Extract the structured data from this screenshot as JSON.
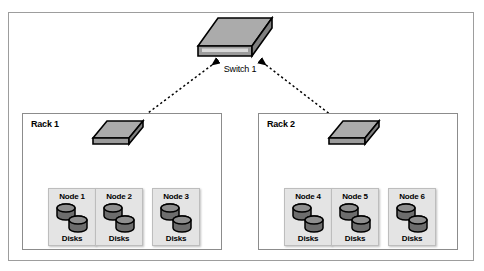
{
  "diagram": {
    "core_switch": {
      "label": "Switch 1",
      "icon": "network-switch-icon"
    },
    "racks": [
      {
        "label": "Rack 1",
        "switch": {
          "icon": "network-switch-icon"
        },
        "nodes": [
          {
            "label": "Node 1",
            "storage_label": "Disks",
            "icon": "disk-stack-icon"
          },
          {
            "label": "Node 2",
            "storage_label": "Disks",
            "icon": "disk-stack-icon"
          },
          {
            "label": "Node 3",
            "storage_label": "Disks",
            "icon": "disk-stack-icon"
          }
        ]
      },
      {
        "label": "Rack 2",
        "switch": {
          "icon": "network-switch-icon"
        },
        "nodes": [
          {
            "label": "Node 4",
            "storage_label": "Disks",
            "icon": "disk-stack-icon"
          },
          {
            "label": "Node 5",
            "storage_label": "Disks",
            "icon": "disk-stack-icon"
          },
          {
            "label": "Node 6",
            "storage_label": "Disks",
            "icon": "disk-stack-icon"
          }
        ]
      }
    ],
    "links": [
      {
        "from": "Switch 1",
        "to": "Rack 1 switch",
        "style": "dotted-bidirectional"
      },
      {
        "from": "Switch 1",
        "to": "Rack 2 switch",
        "style": "dotted-bidirectional"
      },
      {
        "from": "Rack 1 switch",
        "to": "Node 1",
        "style": "dotted-bidirectional"
      },
      {
        "from": "Rack 1 switch",
        "to": "Node 2",
        "style": "dotted-bidirectional"
      },
      {
        "from": "Rack 1 switch",
        "to": "Node 3",
        "style": "dotted-bidirectional"
      },
      {
        "from": "Rack 2 switch",
        "to": "Node 4",
        "style": "dotted-bidirectional"
      },
      {
        "from": "Rack 2 switch",
        "to": "Node 5",
        "style": "dotted-bidirectional"
      },
      {
        "from": "Rack 2 switch",
        "to": "Node 6",
        "style": "dotted-bidirectional"
      }
    ],
    "colors": {
      "switch_top": "#a9a9a9",
      "switch_side": "#8a8a8a",
      "switch_front": "#9a9a9a",
      "disk_body": "#6d6d6d",
      "disk_top": "#8b8b8b",
      "node_fill": "#e4e4e4",
      "outline": "#000000",
      "frame": "#9d9d9d"
    }
  }
}
